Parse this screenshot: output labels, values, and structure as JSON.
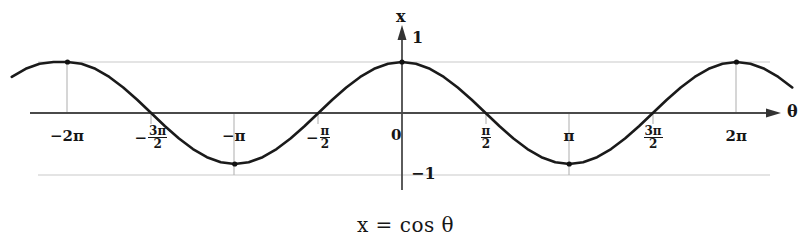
{
  "figure": {
    "caption": "x = cos θ",
    "axis": {
      "x_label": "θ",
      "y_label": "x",
      "y_top_value": "1",
      "y_bottom_value": "−1",
      "origin_label": "0"
    },
    "colors": {
      "curve": "#1a1a1a",
      "axis": "#444444",
      "gridline": "#c9c9c9",
      "text": "#161616",
      "background": "#ffffff"
    },
    "ticks": [
      {
        "id": "tick-neg-2pi",
        "display": "−2π",
        "kind": "plain",
        "theta": -6.283185,
        "px": 67
      },
      {
        "id": "tick-neg-3pi-over-2",
        "display": "−3π/2",
        "kind": "fraction",
        "sign": "−",
        "num": "3π",
        "den": "2",
        "theta": -4.712389,
        "px": 151
      },
      {
        "id": "tick-neg-pi",
        "display": "−π",
        "kind": "plain",
        "theta": -3.141593,
        "px": 234
      },
      {
        "id": "tick-neg-pi-over-2",
        "display": "−π/2",
        "kind": "fraction",
        "sign": "−",
        "num": "π",
        "den": "2",
        "theta": -1.570796,
        "px": 318
      },
      {
        "id": "tick-zero",
        "display": "0",
        "kind": "plain",
        "theta": 0,
        "px": 402
      },
      {
        "id": "tick-pi-over-2",
        "display": "π/2",
        "kind": "fraction",
        "sign": "",
        "num": "π",
        "den": "2",
        "theta": 1.570796,
        "px": 486
      },
      {
        "id": "tick-pi",
        "display": "π",
        "kind": "plain",
        "theta": 3.141593,
        "px": 569
      },
      {
        "id": "tick-3pi-over-2",
        "display": "3π/2",
        "kind": "fraction",
        "sign": "",
        "num": "3π",
        "den": "2",
        "theta": 4.712389,
        "px": 653
      },
      {
        "id": "tick-2pi",
        "display": "2π",
        "kind": "plain",
        "theta": 6.283185,
        "px": 736
      }
    ],
    "markers": [
      {
        "name": "peak-neg-2pi",
        "theta": -6.283185,
        "x": 1
      },
      {
        "name": "trough-neg-pi",
        "theta": -3.141593,
        "x": -1
      },
      {
        "name": "peak-zero",
        "theta": 0,
        "x": 1
      },
      {
        "name": "trough-pi",
        "theta": 3.141593,
        "x": -1
      },
      {
        "name": "peak-2pi",
        "theta": 6.283185,
        "x": 1
      }
    ]
  },
  "chart_data": {
    "type": "line",
    "title": "",
    "caption": "x = cos θ",
    "function": "x = cos(θ)",
    "xlabel": "θ",
    "ylabel": "x",
    "xlim": [
      -7.33,
      7.33
    ],
    "ylim": [
      -1.35,
      1.45
    ],
    "grid": true,
    "gridlines_y": [
      1,
      -1
    ],
    "legend": "none",
    "xtick_values": [
      -6.283185,
      -4.712389,
      -3.141593,
      -1.570796,
      0,
      1.570796,
      3.141593,
      4.712389,
      6.283185
    ],
    "xtick_labels": [
      "−2π",
      "−3π/2",
      "−π",
      "−π/2",
      "0",
      "π/2",
      "π",
      "3π/2",
      "2π"
    ],
    "ytick_values": [
      1,
      -1
    ],
    "ytick_labels": [
      "1",
      "−1"
    ],
    "series": [
      {
        "name": "cos θ",
        "x": [
          -7.33,
          -7.069,
          -6.807,
          -6.545,
          -6.283,
          -6.021,
          -5.76,
          -5.498,
          -5.236,
          -4.974,
          -4.712,
          -4.451,
          -4.189,
          -3.927,
          -3.665,
          -3.403,
          -3.142,
          -2.88,
          -2.618,
          -2.356,
          -2.094,
          -1.833,
          -1.571,
          -1.309,
          -1.047,
          -0.785,
          -0.524,
          -0.262,
          0.0,
          0.262,
          0.524,
          0.785,
          1.047,
          1.309,
          1.571,
          1.833,
          2.094,
          2.356,
          2.618,
          2.88,
          3.142,
          3.403,
          3.665,
          3.927,
          4.189,
          4.451,
          4.712,
          4.974,
          5.236,
          5.498,
          5.76,
          6.021,
          6.283,
          6.545,
          6.807,
          7.069,
          7.33
        ],
        "y": [
          0.707,
          0.866,
          0.966,
          1.0,
          1.0,
          0.966,
          0.866,
          0.707,
          0.5,
          0.259,
          0.0,
          -0.259,
          -0.5,
          -0.707,
          -0.866,
          -0.966,
          -1.0,
          -0.966,
          -0.866,
          -0.707,
          -0.5,
          -0.259,
          0.0,
          0.259,
          0.5,
          0.707,
          0.866,
          0.966,
          1.0,
          0.966,
          0.866,
          0.707,
          0.5,
          0.259,
          0.0,
          -0.259,
          -0.5,
          -0.707,
          -0.866,
          -0.966,
          -1.0,
          -0.966,
          -0.866,
          -0.707,
          -0.5,
          -0.259,
          0.0,
          0.259,
          0.5,
          0.707,
          0.866,
          0.966,
          1.0,
          0.966,
          0.866,
          0.707,
          0.5
        ]
      }
    ],
    "annotations": []
  }
}
